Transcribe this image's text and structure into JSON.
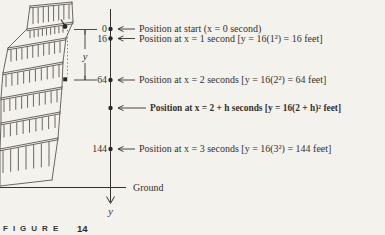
{
  "colors": {
    "paper": "#f4f2ec",
    "ink": "#35312c",
    "tower_ink": "#5e5850"
  },
  "caption": {
    "label": "FIGURE",
    "number": "14"
  },
  "axis": {
    "down_label": "y",
    "ground_label": "Ground"
  },
  "dimension": {
    "label": "y"
  },
  "annotations": [
    {
      "tick": "0",
      "text": "Position at start (x = 0 second)",
      "bold": false
    },
    {
      "tick": "16",
      "text": "Position at x = 1 second [y = 16(1²) = 16 feet]",
      "bold": false
    },
    {
      "tick": "64",
      "text": "Position at x = 2 seconds [y = 16(2²) = 64 feet]",
      "bold": false
    },
    {
      "tick": null,
      "text": "Position at x = 2 + h seconds [y = 16(2 + h)² feet]",
      "bold": true
    },
    {
      "tick": "144",
      "text": "Position at x = 3 seconds [y = 16(3²) = 144 feet]",
      "bold": false
    }
  ]
}
